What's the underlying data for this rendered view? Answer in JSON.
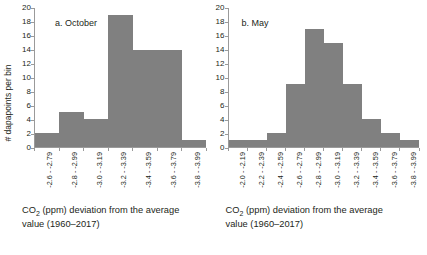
{
  "figure": {
    "background": "#ffffff",
    "bar_color": "#808080",
    "axis_color": "#9a9a9a"
  },
  "panels": [
    {
      "id": "october",
      "title": "a. October",
      "y_axis": {
        "label": "# dapapoints per bin",
        "ticks": [
          "0",
          "2",
          "4",
          "6",
          "8",
          "10",
          "12",
          "14",
          "16",
          "18",
          "20"
        ]
      },
      "x_tick_labels": [
        "-2.6 - -2.79",
        "-2.8 - -2.99",
        "-3.0 - -3.19",
        "-3.2 - -3.39",
        "-3.4 - -3.59",
        "-3.6 - -3.79",
        "-3.8 - -3.99"
      ],
      "caption_line1": "CO",
      "caption_sub": "2",
      "caption_line1b": " (ppm) deviation from the average",
      "caption_line2": "value (1960–2017)"
    },
    {
      "id": "may",
      "title": "b. May",
      "y_axis": {
        "label": "",
        "ticks": [
          "0",
          "2",
          "4",
          "6",
          "8",
          "10",
          "12",
          "14",
          "16",
          "18",
          "20"
        ]
      },
      "x_tick_labels": [
        "-2.0 - -2.19",
        "-2.2 - -2.39",
        "-2.4 - -2.59",
        "-2.6 - -2.79",
        "-2.8 - -2.99",
        "-3.0 - -3.19",
        "-3.2 - -3.39",
        "-3.4 - -3.59",
        "-3.6 - -3.79",
        "-3.8 - -3.99"
      ],
      "caption_line1": "CO",
      "caption_sub": "2",
      "caption_line1b": " (ppm) deviation from the average",
      "caption_line2": "value (1960–2017)"
    }
  ],
  "chart_data": [
    {
      "type": "bar",
      "title": "a. October",
      "xlabel": "CO2 (ppm) deviation from the average value (1960–2017)",
      "ylabel": "# dapapoints per bin",
      "categories": [
        "-2.6 - -2.79",
        "-2.8 - -2.99",
        "-3.0 - -3.19",
        "-3.2 - -3.39",
        "-3.4 - -3.59",
        "-3.6 - -3.79",
        "-3.8 - -3.99"
      ],
      "values": [
        2,
        5,
        4,
        19,
        14,
        14,
        1
      ],
      "ylim": [
        0,
        20
      ],
      "ytick_step": 2,
      "grid": false,
      "legend": false,
      "bar_color": "#808080"
    },
    {
      "type": "bar",
      "title": "b. May",
      "xlabel": "CO2 (ppm) deviation from the average value (1960–2017)",
      "ylabel": "",
      "categories": [
        "-2.0 - -2.19",
        "-2.2 - -2.39",
        "-2.4 - -2.59",
        "-2.6 - -2.79",
        "-2.8 - -2.99",
        "-3.0 - -3.19",
        "-3.2 - -3.39",
        "-3.4 - -3.59",
        "-3.6 - -3.79",
        "-3.8 - -3.99"
      ],
      "values": [
        1,
        1,
        2,
        9,
        17,
        15,
        9,
        4,
        2,
        1
      ],
      "ylim": [
        0,
        20
      ],
      "ytick_step": 2,
      "grid": false,
      "legend": false,
      "bar_color": "#808080"
    }
  ]
}
